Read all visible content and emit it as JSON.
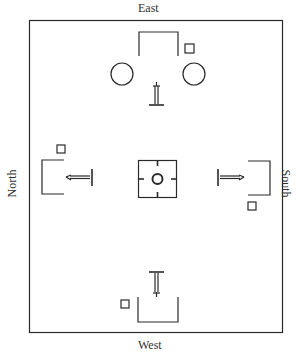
{
  "diagram": {
    "type": "ritual site layout plan",
    "labels": {
      "top": "East",
      "bottom": "West",
      "left": "North",
      "right": "South"
    },
    "elements": [
      {
        "name": "east-enclosure",
        "shape": "open bracket",
        "side": "East"
      },
      {
        "name": "east-circle-left",
        "shape": "circle",
        "side": "East"
      },
      {
        "name": "east-circle-right",
        "shape": "circle",
        "side": "East"
      },
      {
        "name": "east-marker-square",
        "shape": "small square",
        "side": "East"
      },
      {
        "name": "east-figure",
        "shape": "staff/post with arrow",
        "side": "East"
      },
      {
        "name": "north-enclosure",
        "shape": "open bracket",
        "side": "North"
      },
      {
        "name": "north-marker-square",
        "shape": "small square",
        "side": "North"
      },
      {
        "name": "north-figure",
        "shape": "staff/post with arrow",
        "side": "North"
      },
      {
        "name": "south-enclosure",
        "shape": "open bracket",
        "side": "South"
      },
      {
        "name": "south-marker-square",
        "shape": "small square",
        "side": "South"
      },
      {
        "name": "south-figure",
        "shape": "staff/post with arrow",
        "side": "South"
      },
      {
        "name": "west-enclosure",
        "shape": "open bracket",
        "side": "West"
      },
      {
        "name": "west-marker-square",
        "shape": "small square",
        "side": "West"
      },
      {
        "name": "west-figure",
        "shape": "staff/post with arrow",
        "side": "West"
      },
      {
        "name": "center-altar",
        "shape": "square with center circle and four ticks",
        "side": "Center"
      }
    ],
    "colors": {
      "stroke": "#2a2a2a",
      "background": "#ffffff"
    }
  }
}
